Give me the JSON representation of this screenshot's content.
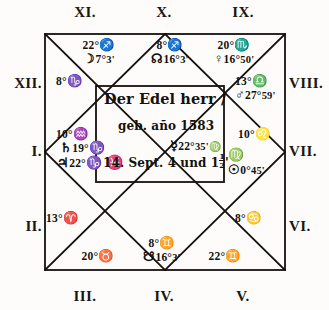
{
  "document": {
    "title": "Der Edel herr — Square horoscope chart",
    "inscription": {
      "title": "Der Edel herr /",
      "born": "geb. año 1583",
      "date_prefix": "14. Sept. 4 und 1",
      "date_fraction_num": "1",
      "date_fraction_den": "2",
      "date_suffix": "'"
    }
  },
  "houses": [
    {
      "id": "I",
      "numeral": "I."
    },
    {
      "id": "II",
      "numeral": "II."
    },
    {
      "id": "III",
      "numeral": "III."
    },
    {
      "id": "IV",
      "numeral": "IV."
    },
    {
      "id": "V",
      "numeral": "V."
    },
    {
      "id": "VI",
      "numeral": "VI."
    },
    {
      "id": "VII",
      "numeral": "VII."
    },
    {
      "id": "VIII",
      "numeral": "VIII."
    },
    {
      "id": "IX",
      "numeral": "IX."
    },
    {
      "id": "X",
      "numeral": "X."
    },
    {
      "id": "XI",
      "numeral": "XI."
    },
    {
      "id": "XII",
      "numeral": "XII."
    }
  ],
  "cusps": {
    "xi": {
      "degree": "22°",
      "sign": "♐"
    },
    "x": {
      "degree": "8°",
      "sign": "♐"
    },
    "ix": {
      "degree": "20°",
      "sign": "♏"
    },
    "viii": {
      "degree": "13°",
      "sign": "♎"
    },
    "vii": {
      "degree": "10°",
      "sign": "♌"
    },
    "vi": {
      "degree": "8°",
      "sign": "♋"
    },
    "v": {
      "degree": "22°",
      "sign": "♊"
    },
    "iv": {
      "degree": "8°",
      "sign": "♊"
    },
    "iii": {
      "degree": "20°",
      "sign": "♉"
    },
    "ii": {
      "degree": "13°",
      "sign": "♈"
    },
    "i": {
      "degree": "10°",
      "sign": "♒"
    },
    "xii": {
      "degree": "8°",
      "sign": "♑"
    }
  },
  "planets": {
    "moon": {
      "symbol": "☽",
      "degree": "7°",
      "minute": "3'"
    },
    "north_node": {
      "symbol": "☊",
      "degree": "16°",
      "minute": "3'"
    },
    "venus": {
      "symbol": "♀",
      "degree": "16°",
      "minute": "50'"
    },
    "mars": {
      "symbol": "♂",
      "degree": "27°",
      "minute": "59'"
    },
    "sun": {
      "symbol": "☉",
      "degree": "0°",
      "minute": "45'",
      "sign": "♍"
    },
    "mercury": {
      "symbol": "☿",
      "degree": "22°",
      "minute": "35'",
      "sign": "♍"
    },
    "south_node": {
      "symbol": "☋",
      "degree": "16°",
      "minute": "3'"
    },
    "saturn": {
      "symbol": "♄",
      "degree": "19°",
      "sign": "♑"
    },
    "jupiter": {
      "symbol": "♃",
      "degree": "22°",
      "sign": "♑"
    },
    "pisces_mark": {
      "symbol": "♓"
    }
  },
  "style": {
    "ink": "#14110e",
    "paper": "#fdfcfa"
  }
}
